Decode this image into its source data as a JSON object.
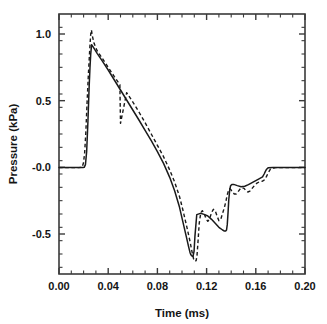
{
  "chart_data": {
    "type": "line",
    "title": "",
    "xlabel": "Time (ms)",
    "ylabel": "Pressure (kPa)",
    "xlim": [
      0.0,
      0.2
    ],
    "ylim": [
      -0.8,
      1.15
    ],
    "grid": false,
    "legend": "none",
    "xticks": [
      0.0,
      0.04,
      0.08,
      0.12,
      0.16,
      0.2
    ],
    "xtick_labels": [
      "0.00",
      "0.04",
      "0.08",
      "0.12",
      "0.16",
      "0.20"
    ],
    "x_minor_count_between": 3,
    "yticks": [
      1.0,
      0.5,
      0.0,
      -0.5
    ],
    "ytick_labels": [
      "1.0",
      "0.5",
      "-0.0",
      "-0.5"
    ],
    "y_minor_count_between": 4,
    "series": [
      {
        "name": "solid",
        "style": "solid",
        "color": "#1a1a1a",
        "x": [
          0.0,
          0.004,
          0.008,
          0.012,
          0.016,
          0.0195,
          0.0205,
          0.0215,
          0.0225,
          0.0235,
          0.0245,
          0.0252,
          0.0258,
          0.0265,
          0.028,
          0.031,
          0.035,
          0.04,
          0.045,
          0.05,
          0.055,
          0.06,
          0.065,
          0.07,
          0.075,
          0.08,
          0.085,
          0.09,
          0.094,
          0.098,
          0.101,
          0.1035,
          0.1055,
          0.1065,
          0.1072,
          0.1078,
          0.1085,
          0.109,
          0.1098,
          0.1105,
          0.112,
          0.115,
          0.118,
          0.121,
          0.124,
          0.127,
          0.13,
          0.133,
          0.1345,
          0.1355,
          0.1362,
          0.1368,
          0.1375,
          0.138,
          0.1388,
          0.1395,
          0.1405,
          0.142,
          0.145,
          0.148,
          0.151,
          0.154,
          0.157,
          0.16,
          0.163,
          0.1655,
          0.1668,
          0.1678,
          0.1688,
          0.17,
          0.174,
          0.18,
          0.186,
          0.192,
          0.2
        ],
        "y": [
          -0.002,
          -0.002,
          -0.002,
          -0.002,
          -0.002,
          -0.002,
          0.0,
          0.02,
          0.12,
          0.34,
          0.6,
          0.75,
          0.85,
          0.92,
          0.9,
          0.855,
          0.8,
          0.73,
          0.655,
          0.58,
          0.505,
          0.43,
          0.355,
          0.278,
          0.2,
          0.118,
          0.03,
          -0.075,
          -0.175,
          -0.3,
          -0.42,
          -0.52,
          -0.6,
          -0.638,
          -0.655,
          -0.663,
          -0.667,
          -0.665,
          -0.63,
          -0.52,
          -0.355,
          -0.345,
          -0.353,
          -0.365,
          -0.39,
          -0.42,
          -0.45,
          -0.47,
          -0.478,
          -0.478,
          -0.47,
          -0.43,
          -0.33,
          -0.245,
          -0.17,
          -0.138,
          -0.128,
          -0.128,
          -0.137,
          -0.145,
          -0.142,
          -0.13,
          -0.115,
          -0.1,
          -0.085,
          -0.072,
          -0.05,
          -0.03,
          -0.014,
          -0.004,
          -0.002,
          -0.002,
          -0.002,
          -0.002,
          -0.002
        ]
      },
      {
        "name": "dashed",
        "style": "dashed",
        "color": "#1a1a1a",
        "x": [
          0.0,
          0.004,
          0.008,
          0.012,
          0.016,
          0.0188,
          0.0198,
          0.0208,
          0.0218,
          0.0228,
          0.0238,
          0.0246,
          0.0252,
          0.0258,
          0.0264,
          0.027,
          0.0285,
          0.031,
          0.035,
          0.04,
          0.045,
          0.0495,
          0.05,
          0.055,
          0.06,
          0.065,
          0.07,
          0.075,
          0.08,
          0.085,
          0.09,
          0.094,
          0.098,
          0.101,
          0.104,
          0.1065,
          0.1085,
          0.1095,
          0.1105,
          0.1115,
          0.1122,
          0.113,
          0.114,
          0.1152,
          0.1165,
          0.118,
          0.1195,
          0.121,
          0.1225,
          0.124,
          0.1255,
          0.127,
          0.1285,
          0.13,
          0.1315,
          0.133,
          0.1345,
          0.1358,
          0.1368,
          0.1378,
          0.1388,
          0.1398,
          0.141,
          0.1425,
          0.144,
          0.1455,
          0.147,
          0.1488,
          0.1505,
          0.152,
          0.1535,
          0.1552,
          0.157,
          0.159,
          0.161,
          0.163,
          0.165,
          0.1665,
          0.1678,
          0.169,
          0.1705,
          0.172,
          0.176,
          0.182,
          0.19,
          0.2
        ],
        "y": [
          -0.002,
          -0.002,
          -0.002,
          -0.002,
          -0.002,
          0.0,
          0.03,
          0.1,
          0.26,
          0.48,
          0.68,
          0.82,
          0.92,
          1.0,
          1.03,
          0.99,
          0.93,
          0.875,
          0.82,
          0.75,
          0.68,
          0.62,
          0.33,
          0.56,
          0.49,
          0.415,
          0.335,
          0.25,
          0.165,
          0.08,
          -0.02,
          -0.11,
          -0.22,
          -0.33,
          -0.45,
          -0.555,
          -0.65,
          -0.69,
          -0.705,
          -0.7,
          -0.66,
          -0.56,
          -0.42,
          -0.345,
          -0.325,
          -0.345,
          -0.385,
          -0.405,
          -0.385,
          -0.34,
          -0.315,
          -0.325,
          -0.365,
          -0.4,
          -0.39,
          -0.345,
          -0.3,
          -0.25,
          -0.205,
          -0.175,
          -0.16,
          -0.168,
          -0.185,
          -0.2,
          -0.2,
          -0.185,
          -0.165,
          -0.152,
          -0.158,
          -0.175,
          -0.185,
          -0.178,
          -0.158,
          -0.135,
          -0.118,
          -0.108,
          -0.105,
          -0.098,
          -0.085,
          -0.062,
          -0.035,
          -0.012,
          -0.002,
          -0.002,
          -0.002,
          -0.002
        ]
      }
    ]
  },
  "axes": {
    "xlabel": "Time (ms)",
    "ylabel": "Pressure (kPa)"
  }
}
